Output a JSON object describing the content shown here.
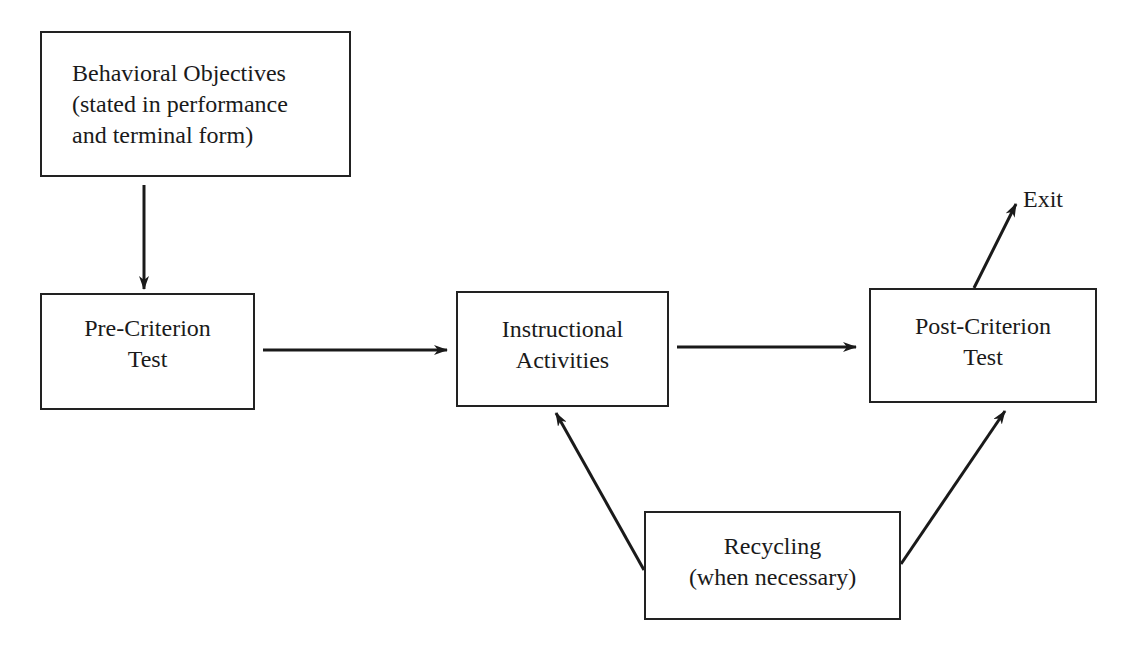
{
  "diagram": {
    "nodes": {
      "objectives": {
        "lines": [
          "Behavioral Objectives",
          "(stated in performance",
          "and terminal form)"
        ]
      },
      "pre_test": {
        "lines": [
          "Pre-Criterion",
          "Test"
        ]
      },
      "instruction": {
        "lines": [
          "Instructional",
          "Activities"
        ]
      },
      "post_test": {
        "lines": [
          "Post-Criterion",
          "Test"
        ]
      },
      "recycling": {
        "lines": [
          "Recycling",
          "(when necessary)"
        ]
      }
    },
    "exit_label": "Exit",
    "edges": [
      {
        "from": "objectives",
        "to": "pre_test"
      },
      {
        "from": "pre_test",
        "to": "instruction"
      },
      {
        "from": "instruction",
        "to": "post_test"
      },
      {
        "from": "post_test",
        "to": "exit"
      },
      {
        "from": "recycling",
        "to": "instruction"
      },
      {
        "from": "recycling",
        "to": "post_test"
      }
    ]
  }
}
